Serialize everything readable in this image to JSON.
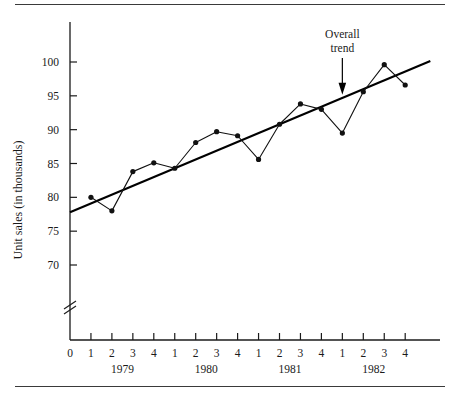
{
  "chart_data": {
    "type": "line",
    "title": "",
    "subtitle": "",
    "xlabel": "",
    "ylabel": "Unit sales (in thousands)",
    "grid": false,
    "legend_position": "none",
    "axis_break": true,
    "origin_label": "0",
    "ylim": [
      68,
      103
    ],
    "y_ticks": [
      70,
      75,
      80,
      85,
      90,
      95,
      100
    ],
    "y_tick_labels": [
      "70",
      "75",
      "80",
      "85",
      "90",
      "95",
      "100"
    ],
    "x_tick_labels": [
      "1",
      "2",
      "3",
      "4",
      "1",
      "2",
      "3",
      "4",
      "1",
      "2",
      "3",
      "4",
      "1",
      "2",
      "3",
      "4"
    ],
    "group_labels": [
      "1979",
      "1980",
      "1981",
      "1982"
    ],
    "categories": [
      "1979 Q1",
      "1979 Q2",
      "1979 Q3",
      "1979 Q4",
      "1980 Q1",
      "1980 Q2",
      "1980 Q3",
      "1980 Q4",
      "1981 Q1",
      "1981 Q2",
      "1981 Q3",
      "1981 Q4",
      "1982 Q1",
      "1982 Q2",
      "1982 Q3",
      "1982 Q4"
    ],
    "series": [
      {
        "name": "Unit sales",
        "values": [
          80.0,
          78.0,
          83.8,
          85.1,
          84.3,
          88.1,
          89.7,
          89.1,
          85.6,
          90.8,
          93.8,
          93.0,
          89.5,
          95.6,
          99.6,
          96.6
        ]
      },
      {
        "name": "Overall trend",
        "values": [
          79.1,
          80.4,
          81.7,
          83.0,
          84.3,
          85.6,
          86.9,
          88.2,
          89.5,
          90.8,
          92.1,
          93.4,
          94.7,
          96.0,
          97.3,
          98.6
        ]
      }
    ],
    "annotations": [
      {
        "text_line1": "Overall",
        "text_line2": "trend",
        "points_to_category": "1982 Q1"
      }
    ]
  }
}
